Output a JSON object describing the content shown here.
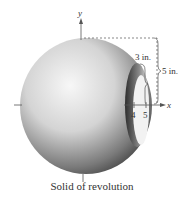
{
  "figure": {
    "caption": "Solid of revolution",
    "axes": {
      "x_label": "x",
      "y_label": "y"
    },
    "ticks": [
      {
        "label": "4",
        "x": 4
      },
      {
        "label": "5",
        "x": 5
      }
    ],
    "dimensions": [
      {
        "label": "3 in.",
        "meaning": "inner radius"
      },
      {
        "label": "5 in.",
        "meaning": "outer radius"
      }
    ],
    "colors": {
      "solid_light": "#f2f2f2",
      "solid_dark": "#3a3a3a",
      "lines": "#555555"
    }
  }
}
